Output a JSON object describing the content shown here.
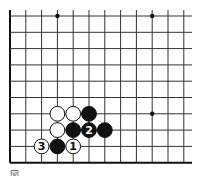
{
  "diagram": {
    "type": "go-board-fragment",
    "grid": {
      "origin_x": 10,
      "origin_y": 16,
      "spacing_x": 15.8,
      "spacing_y": 16.3,
      "columns": 12,
      "rows": 10,
      "edges": {
        "left": true,
        "bottom": true,
        "top": false,
        "right": false
      },
      "line_color": "#333333",
      "edge_color": "#111111"
    },
    "star_points": [
      {
        "col": 3,
        "row": 0
      },
      {
        "col": 9,
        "row": 0
      },
      {
        "col": 9,
        "row": 6
      }
    ],
    "stones": [
      {
        "color": "white",
        "col": 3,
        "row": 6,
        "label": ""
      },
      {
        "color": "white",
        "col": 4,
        "row": 6,
        "label": ""
      },
      {
        "color": "black",
        "col": 5,
        "row": 6,
        "label": ""
      },
      {
        "color": "white",
        "col": 3,
        "row": 7,
        "label": ""
      },
      {
        "color": "black",
        "col": 4,
        "row": 7,
        "label": ""
      },
      {
        "color": "black",
        "col": 5,
        "row": 7,
        "label": "2"
      },
      {
        "color": "black",
        "col": 6,
        "row": 7,
        "label": ""
      },
      {
        "color": "white",
        "col": 2,
        "row": 8,
        "label": "3"
      },
      {
        "color": "black",
        "col": 3,
        "row": 8,
        "label": ""
      },
      {
        "color": "white",
        "col": 4,
        "row": 8,
        "label": "1"
      }
    ]
  },
  "caption": "図"
}
